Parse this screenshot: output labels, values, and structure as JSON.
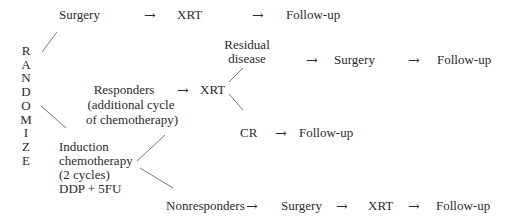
{
  "diagram": {
    "randomize_letters": [
      "R",
      "A",
      "N",
      "D",
      "O",
      "M",
      "I",
      "Z",
      "E"
    ],
    "arm1": {
      "steps": [
        "Surgery",
        "XRT",
        "Follow-up"
      ],
      "arrow": "→"
    },
    "arm2": {
      "induction_lines": [
        "Induction",
        "chemotherapy",
        "(2 cycles)",
        "DDP + 5FU"
      ],
      "responders": {
        "label_lines": [
          "Responders",
          "(additional cycle",
          "of chemotherapy)"
        ],
        "arrow": "→",
        "next": "XRT",
        "residual": {
          "label_lines": [
            "Residual",
            "disease"
          ],
          "steps": [
            "Surgery",
            "Follow-up"
          ],
          "arrow": "→"
        },
        "cr": {
          "label": "CR",
          "steps": [
            "Follow-up"
          ],
          "arrow": "→"
        }
      },
      "nonresponders": {
        "label": "Nonresponders",
        "steps": [
          "Surgery",
          "XRT",
          "Follow-up"
        ],
        "arrow": "→"
      }
    },
    "line_color": "#555555",
    "text_color": "#2a2a2a"
  }
}
